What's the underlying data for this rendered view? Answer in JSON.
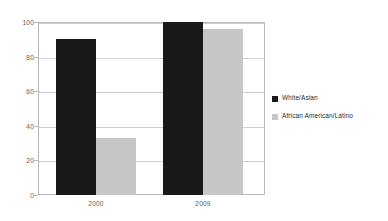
{
  "chart_data": {
    "type": "bar",
    "title": "",
    "subtitle": "",
    "xlabel": "",
    "ylabel": "",
    "categories": [
      "2000",
      "2009"
    ],
    "series": [
      {
        "name": "White/Asian",
        "color": "#191919",
        "values": [
          90,
          100
        ]
      },
      {
        "name": "African American/Latino",
        "color": "#c6c6c6",
        "values": [
          33,
          96
        ]
      }
    ],
    "ylim": [
      0,
      100
    ],
    "ytick_values": [
      0,
      20,
      40,
      60,
      80,
      100
    ],
    "ytick_labels": [
      "0",
      "20",
      "40",
      "60",
      "80",
      "100"
    ],
    "grid": "horizontal",
    "legend_position": "right",
    "annotations": []
  },
  "legend": {
    "entries": [
      {
        "label": "White/Asian"
      },
      {
        "label": "African American/Latino"
      }
    ]
  },
  "axes": {
    "y_labels": [
      "100",
      "80",
      "60",
      "40",
      "20",
      "0"
    ],
    "x_labels": [
      "2000",
      "2009"
    ]
  }
}
